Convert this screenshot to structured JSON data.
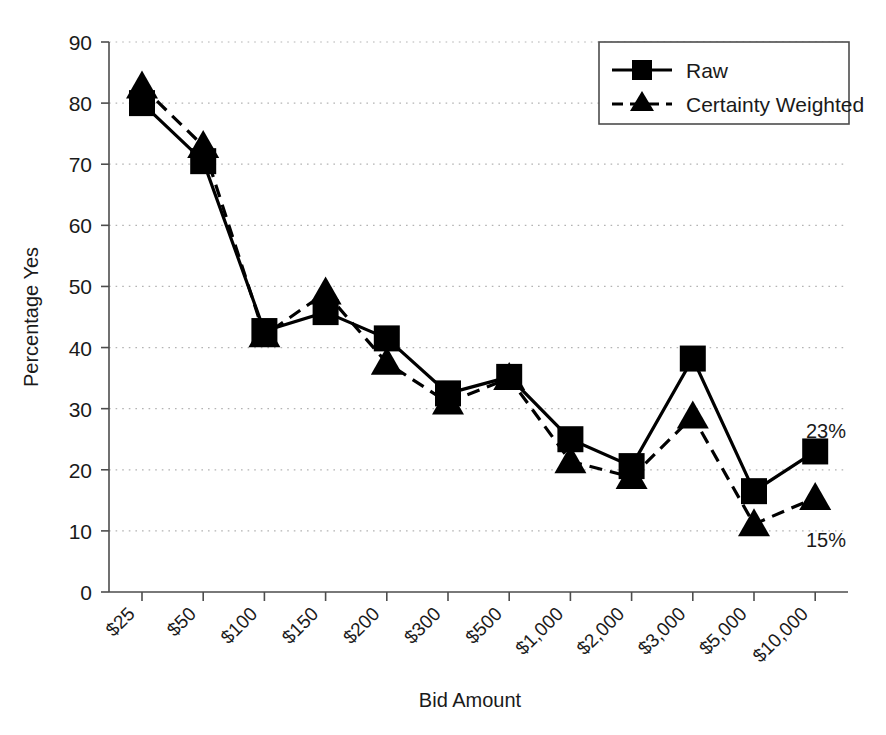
{
  "chart_data": {
    "type": "line",
    "title": "",
    "xlabel": "Bid Amount",
    "ylabel": "Percentage Yes",
    "categories": [
      "$25",
      "$50",
      "$100",
      "$150",
      "$200",
      "$300",
      "$500",
      "$1,000",
      "$2,000",
      "$3,000",
      "$5,000",
      "$10,000"
    ],
    "ylim": [
      0,
      90
    ],
    "yticks": [
      0,
      10,
      20,
      30,
      40,
      50,
      60,
      70,
      80,
      90
    ],
    "grid": true,
    "legend_position": "top-right",
    "series": [
      {
        "name": "Raw",
        "marker": "square",
        "linestyle": "solid",
        "color": "#000000",
        "values": [
          80,
          70.5,
          42.7,
          45.8,
          41.5,
          32.5,
          35.2,
          25,
          20.6,
          38.2,
          16.5,
          23
        ]
      },
      {
        "name": "Certainty Weighted",
        "marker": "triangle",
        "linestyle": "dashed",
        "color": "#000000",
        "values": [
          82.7,
          73,
          42,
          49,
          37.5,
          31,
          35,
          21.4,
          18.8,
          28.7,
          11.1,
          15.4
        ]
      }
    ],
    "annotations": [
      {
        "text": "23%",
        "series": "Raw",
        "category": "$10,000"
      },
      {
        "text": "15%",
        "series": "Certainty Weighted",
        "category": "$10,000"
      }
    ]
  },
  "axes": {
    "y_title": "Percentage Yes",
    "x_title": "Bid Amount",
    "y_ticks": [
      "0",
      "10",
      "20",
      "30",
      "40",
      "50",
      "60",
      "70",
      "80",
      "90"
    ],
    "x_ticks": [
      "$25",
      "$50",
      "$100",
      "$150",
      "$200",
      "$300",
      "$500",
      "$1,000",
      "$2,000",
      "$3,000",
      "$5,000",
      "$10,000"
    ]
  },
  "legend": {
    "items": [
      {
        "label": "Raw",
        "marker": "square-marker",
        "style": "solid"
      },
      {
        "label": "Certainty Weighted",
        "marker": "triangle-marker",
        "style": "dashed"
      }
    ]
  },
  "annotations": {
    "raw_end": "23%",
    "weighted_end": "15%"
  },
  "colors": {
    "ink": "#000000",
    "axis": "#4d4d4d",
    "grid": "#b3b3b3",
    "background": "#ffffff"
  }
}
